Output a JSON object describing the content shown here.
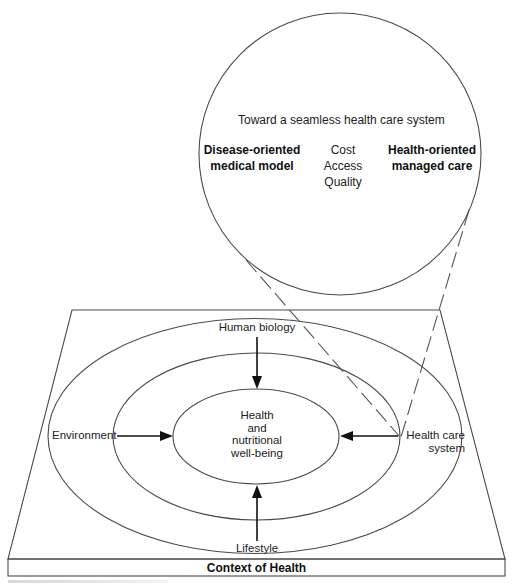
{
  "zoom_circle": {
    "heading": "Toward a seamless health care system",
    "left_model": {
      "line1": "Disease-oriented",
      "line2": "medical model"
    },
    "center_factors": [
      "Cost",
      "Access",
      "Quality"
    ],
    "right_model": {
      "line1": "Health-oriented",
      "line2": "managed care"
    }
  },
  "rings": {
    "center": {
      "lines": [
        "Health",
        "and",
        "nutritional",
        "well-being"
      ]
    },
    "determinants": {
      "top": "Human biology",
      "left": "Environment",
      "right_line1": "Health care",
      "right_line2": "system",
      "bottom": "Lifestyle"
    }
  },
  "base": {
    "label": "Context of Health"
  },
  "colors": {
    "line": "#4a4a4a",
    "arrow": "#111111",
    "text": "#222222",
    "background": "#ffffff"
  }
}
